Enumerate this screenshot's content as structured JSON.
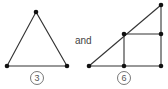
{
  "figures": {
    "connector": "and",
    "triangle": {
      "label": "3",
      "vertices": [
        [
          36,
          12
        ],
        [
          7,
          66
        ],
        [
          67,
          66
        ]
      ],
      "label_center": [
        37,
        78
      ]
    },
    "subdivided_triangle": {
      "label": "6",
      "vertices": [
        [
          89,
          66
        ],
        [
          124,
          66
        ],
        [
          161,
          66
        ],
        [
          161,
          5
        ],
        [
          124,
          34
        ],
        [
          161,
          34
        ]
      ],
      "label_center": [
        124,
        78
      ]
    }
  }
}
